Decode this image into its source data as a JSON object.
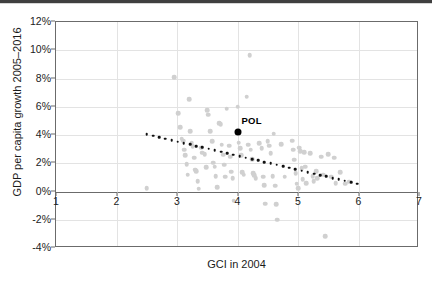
{
  "chart_data": {
    "type": "scatter",
    "title": "",
    "xlabel": "GCI in 2004",
    "ylabel": "GDP per capita growth 2005–2016",
    "xlim": [
      1,
      7
    ],
    "ylim": [
      -4,
      12
    ],
    "grid": true,
    "legend": "none",
    "x_ticks": [
      "1",
      "2",
      "3",
      "4",
      "5",
      "6",
      "7"
    ],
    "x_tick_values": [
      1,
      2,
      3,
      4,
      5,
      6,
      7
    ],
    "y_ticks": [
      "-4%",
      "-2%",
      "0%",
      "2%",
      "4%",
      "6%",
      "8%",
      "10%",
      "12%"
    ],
    "y_tick_values": [
      -4,
      -2,
      0,
      2,
      4,
      6,
      8,
      10,
      12
    ],
    "series": [
      {
        "name": "countries",
        "marker": "circle",
        "color": "#d0d0d0",
        "points": [
          [
            2.5,
            0.25
          ],
          [
            2.95,
            8.1
          ],
          [
            3.02,
            5.55
          ],
          [
            3.05,
            4.55
          ],
          [
            3.08,
            3.75
          ],
          [
            3.1,
            3.6
          ],
          [
            3.12,
            2.95
          ],
          [
            3.14,
            2.55
          ],
          [
            3.16,
            1.95
          ],
          [
            3.18,
            1.2
          ],
          [
            3.2,
            6.55
          ],
          [
            3.22,
            4.25
          ],
          [
            3.24,
            3.45
          ],
          [
            3.26,
            3.2
          ],
          [
            3.28,
            2.4
          ],
          [
            3.3,
            1.55
          ],
          [
            3.32,
            1.45
          ],
          [
            3.34,
            0.75
          ],
          [
            3.36,
            0.2
          ],
          [
            3.4,
            3.1
          ],
          [
            3.42,
            2.75
          ],
          [
            3.46,
            2.65
          ],
          [
            3.48,
            1.7
          ],
          [
            3.5,
            5.75
          ],
          [
            3.52,
            5.45
          ],
          [
            3.55,
            4.25
          ],
          [
            3.58,
            3.55
          ],
          [
            3.6,
            2.05
          ],
          [
            3.62,
            1.75
          ],
          [
            3.64,
            1.1
          ],
          [
            3.66,
            0.3
          ],
          [
            3.7,
            4.85
          ],
          [
            3.72,
            4.75
          ],
          [
            3.74,
            3.3
          ],
          [
            3.76,
            2.6
          ],
          [
            3.78,
            1.9
          ],
          [
            3.8,
            1.05
          ],
          [
            3.82,
            5.85
          ],
          [
            3.86,
            3.25
          ],
          [
            3.88,
            2.45
          ],
          [
            3.9,
            1.4
          ],
          [
            3.92,
            0.95
          ],
          [
            3.94,
            -0.65
          ],
          [
            4.0,
            6.0
          ],
          [
            4.02,
            3.45
          ],
          [
            4.04,
            3.05
          ],
          [
            4.06,
            2.55
          ],
          [
            4.08,
            1.35
          ],
          [
            4.1,
            1.2
          ],
          [
            4.15,
            6.7
          ],
          [
            4.18,
            3.3
          ],
          [
            4.2,
            9.65
          ],
          [
            4.22,
            2.95
          ],
          [
            4.24,
            2.3
          ],
          [
            4.26,
            1.3
          ],
          [
            4.28,
            1.15
          ],
          [
            4.3,
            0.95
          ],
          [
            4.36,
            3.4
          ],
          [
            4.4,
            3.05
          ],
          [
            4.42,
            1.05
          ],
          [
            4.44,
            0.45
          ],
          [
            4.46,
            -0.85
          ],
          [
            4.5,
            3.55
          ],
          [
            4.52,
            3.25
          ],
          [
            4.55,
            2.7
          ],
          [
            4.58,
            1.1
          ],
          [
            4.6,
            4.1
          ],
          [
            4.62,
            0.4
          ],
          [
            4.64,
            -0.9
          ],
          [
            4.66,
            -2.0
          ],
          [
            4.72,
            3.35
          ],
          [
            4.78,
            1.05
          ],
          [
            4.9,
            3.6
          ],
          [
            4.92,
            2.95
          ],
          [
            4.94,
            2.25
          ],
          [
            4.96,
            1.3
          ],
          [
            4.98,
            0.55
          ],
          [
            5.0,
            0.25
          ],
          [
            5.02,
            3.1
          ],
          [
            5.04,
            2.85
          ],
          [
            5.06,
            1.65
          ],
          [
            5.08,
            0.85
          ],
          [
            5.1,
            2.8
          ],
          [
            5.12,
            1.75
          ],
          [
            5.14,
            0.6
          ],
          [
            5.2,
            2.7
          ],
          [
            5.24,
            1.1
          ],
          [
            5.26,
            0.75
          ],
          [
            5.3,
            1.45
          ],
          [
            5.32,
            0.95
          ],
          [
            5.38,
            2.45
          ],
          [
            5.42,
            1.2
          ],
          [
            5.5,
            2.65
          ],
          [
            5.55,
            1.05
          ],
          [
            5.6,
            2.4
          ],
          [
            5.62,
            0.6
          ],
          [
            5.7,
            1.35
          ],
          [
            5.78,
            0.55
          ],
          [
            5.85,
            0.7
          ],
          [
            5.45,
            -3.15
          ]
        ]
      }
    ],
    "highlight": {
      "label": "POL",
      "x": 4.0,
      "y": 4.2,
      "color": "#000000"
    },
    "trendline": {
      "style": "dotted",
      "color": "#111111",
      "x_start": 2.5,
      "y_start": 4.05,
      "x_end": 5.98,
      "y_end": 0.55
    }
  }
}
